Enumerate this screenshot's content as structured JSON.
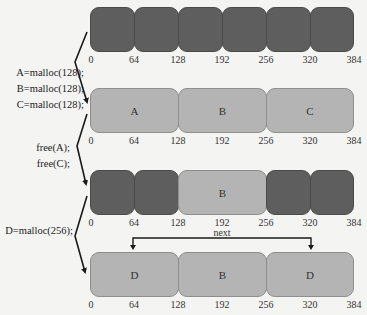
{
  "diagram": {
    "title": "",
    "axis_ticks": [
      "0",
      "64",
      "128",
      "192",
      "256",
      "320",
      "384"
    ],
    "rows": [
      {
        "name": "initial",
        "blocks": [
          {
            "label": "",
            "start": 0,
            "end": 64,
            "state": "used"
          },
          {
            "label": "",
            "start": 64,
            "end": 128,
            "state": "used"
          },
          {
            "label": "",
            "start": 128,
            "end": 192,
            "state": "used"
          },
          {
            "label": "",
            "start": 192,
            "end": 256,
            "state": "used"
          },
          {
            "label": "",
            "start": 256,
            "end": 320,
            "state": "used"
          },
          {
            "label": "",
            "start": 320,
            "end": 384,
            "state": "used"
          }
        ]
      },
      {
        "name": "after-malloc-abc",
        "blocks": [
          {
            "label": "A",
            "start": 0,
            "end": 128,
            "state": "free"
          },
          {
            "label": "B",
            "start": 128,
            "end": 256,
            "state": "free"
          },
          {
            "label": "C",
            "start": 256,
            "end": 384,
            "state": "free"
          }
        ]
      },
      {
        "name": "after-free-ac",
        "blocks": [
          {
            "label": "",
            "start": 0,
            "end": 64,
            "state": "used"
          },
          {
            "label": "",
            "start": 64,
            "end": 128,
            "state": "used"
          },
          {
            "label": "B",
            "start": 128,
            "end": 256,
            "state": "free"
          },
          {
            "label": "",
            "start": 256,
            "end": 320,
            "state": "used"
          },
          {
            "label": "",
            "start": 320,
            "end": 384,
            "state": "used"
          }
        ]
      },
      {
        "name": "after-malloc-d",
        "blocks": [
          {
            "label": "D",
            "start": 0,
            "end": 128,
            "state": "free"
          },
          {
            "label": "B",
            "start": 128,
            "end": 256,
            "state": "free"
          },
          {
            "label": "D",
            "start": 256,
            "end": 384,
            "state": "free"
          }
        ]
      }
    ],
    "operations": [
      {
        "lines": [
          "A=malloc(128);",
          "B=malloc(128);",
          "C=malloc(128);"
        ]
      },
      {
        "lines": [
          "free(A);",
          "free(C);"
        ]
      },
      {
        "lines": [
          "D=malloc(256);"
        ]
      }
    ],
    "link": {
      "label": "next",
      "from": 64,
      "to": 320
    },
    "colors": {
      "used": "#5e5e5e",
      "free": "#b4b4b4",
      "background": "#f4f4f2"
    }
  }
}
